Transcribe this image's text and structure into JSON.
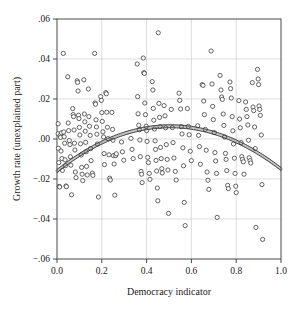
{
  "chart_data": {
    "type": "scatter",
    "title": "",
    "xlabel": "Democracy indicator",
    "ylabel": "Growth rate (unexplained part)",
    "xlim": [
      0.0,
      1.0
    ],
    "ylim": [
      -0.06,
      0.06
    ],
    "xticks": [
      0.0,
      0.2,
      0.4,
      0.6,
      0.8,
      1.0
    ],
    "xtick_labels": [
      "0.0",
      "0.2",
      "0.4",
      "0.6",
      "0.8",
      "1.0"
    ],
    "yticks": [
      0.06,
      0.04,
      0.02,
      0.0,
      -0.02,
      -0.04,
      -0.06
    ],
    "ytick_labels": [
      ".06",
      ".04",
      ".02",
      ".00",
      "−.02",
      "−.04",
      "−.06"
    ],
    "grid": true,
    "grid_color": "#cfcfcf",
    "frame_color": "#4a4a4a",
    "marker": {
      "shape": "circle-open",
      "radius": 2.1,
      "stroke": "#3d3d3d",
      "stroke_width": 0.8,
      "fill": "#ffffff"
    },
    "legend": "none",
    "series": [
      {
        "name": "Countries",
        "type": "scatter",
        "points": [
          [
            0.005,
            0.0076
          ],
          [
            0.005,
            0.0026
          ],
          [
            0.006,
            -0.0046
          ],
          [
            0.008,
            -0.0118
          ],
          [
            0.01,
            -0.0237
          ],
          [
            0.012,
            -0.024
          ],
          [
            0.014,
            0.0018
          ],
          [
            0.016,
            0.0008
          ],
          [
            0.018,
            -0.006
          ],
          [
            0.02,
            0.0031
          ],
          [
            0.022,
            -0.0098
          ],
          [
            0.024,
            -0.0157
          ],
          [
            0.028,
            0.0428
          ],
          [
            0.03,
            0.0035
          ],
          [
            0.032,
            0.0011
          ],
          [
            0.034,
            -0.0021
          ],
          [
            0.036,
            -0.0104
          ],
          [
            0.038,
            -0.0133
          ],
          [
            0.04,
            -0.0235
          ],
          [
            0.042,
            -0.0238
          ],
          [
            0.048,
            0.0311
          ],
          [
            0.05,
            0.008
          ],
          [
            0.052,
            0.0042
          ],
          [
            0.055,
            -0.0008
          ],
          [
            0.058,
            -0.0028
          ],
          [
            0.06,
            -0.0089
          ],
          [
            0.062,
            -0.0131
          ],
          [
            0.065,
            -0.0279
          ],
          [
            0.07,
            0.0152
          ],
          [
            0.072,
            0.0122
          ],
          [
            0.074,
            0.0112
          ],
          [
            0.076,
            0.0045
          ],
          [
            0.078,
            -0.0021
          ],
          [
            0.08,
            -0.0055
          ],
          [
            0.082,
            -0.0165
          ],
          [
            0.085,
            -0.0193
          ],
          [
            0.09,
            0.0291
          ],
          [
            0.092,
            0.0283
          ],
          [
            0.094,
            0.024
          ],
          [
            0.096,
            0.0119
          ],
          [
            0.098,
            0.0102
          ],
          [
            0.1,
            0.0058
          ],
          [
            0.102,
            0.002
          ],
          [
            0.105,
            -0.0024
          ],
          [
            0.108,
            -0.008
          ],
          [
            0.11,
            -0.0142
          ],
          [
            0.112,
            -0.0176
          ],
          [
            0.115,
            -0.0208
          ],
          [
            0.12,
            0.0296
          ],
          [
            0.122,
            0.0125
          ],
          [
            0.124,
            0.0086
          ],
          [
            0.126,
            0.0039
          ],
          [
            0.128,
            -0.0017
          ],
          [
            0.13,
            -0.0064
          ],
          [
            0.132,
            -0.0137
          ],
          [
            0.135,
            -0.018
          ],
          [
            0.14,
            0.025
          ],
          [
            0.142,
            0.0112
          ],
          [
            0.145,
            0.0064
          ],
          [
            0.148,
            0.0018
          ],
          [
            0.15,
            -0.0048
          ],
          [
            0.152,
            -0.0108
          ],
          [
            0.158,
            -0.0171
          ],
          [
            0.16,
            -0.0182
          ],
          [
            0.168,
            0.0428
          ],
          [
            0.17,
            0.018
          ],
          [
            0.172,
            0.0174
          ],
          [
            0.174,
            0.0096
          ],
          [
            0.176,
            0.006
          ],
          [
            0.178,
            0.0024
          ],
          [
            0.18,
            -0.0025
          ],
          [
            0.185,
            -0.029
          ],
          [
            0.195,
            0.0212
          ],
          [
            0.198,
            0.0193
          ],
          [
            0.2,
            0.0132
          ],
          [
            0.202,
            0.0088
          ],
          [
            0.205,
            0.0036
          ],
          [
            0.208,
            0.001
          ],
          [
            0.21,
            -0.0073
          ],
          [
            0.212,
            -0.0128
          ],
          [
            0.218,
            0.0232
          ],
          [
            0.22,
            0.0226
          ],
          [
            0.222,
            0.0134
          ],
          [
            0.225,
            0.0059
          ],
          [
            0.228,
            0.0002
          ],
          [
            0.232,
            -0.0079
          ],
          [
            0.235,
            -0.0196
          ],
          [
            0.238,
            -0.0205
          ],
          [
            0.245,
            0.0133
          ],
          [
            0.248,
            0.0048
          ],
          [
            0.25,
            -0.0006
          ],
          [
            0.252,
            -0.0083
          ],
          [
            0.255,
            -0.0125
          ],
          [
            0.258,
            -0.0281
          ],
          [
            0.262,
            -0.0083
          ],
          [
            0.265,
            -0.0074
          ],
          [
            0.288,
            -0.0015
          ],
          [
            0.292,
            -0.0064
          ],
          [
            0.298,
            -0.0106
          ],
          [
            0.33,
            0.0003
          ],
          [
            0.335,
            -0.0052
          ],
          [
            0.34,
            -0.0098
          ],
          [
            0.358,
            0.0375
          ],
          [
            0.36,
            0.0212
          ],
          [
            0.362,
            0.0126
          ],
          [
            0.365,
            0.0069
          ],
          [
            0.368,
            0.0046
          ],
          [
            0.37,
            -0.0005
          ],
          [
            0.372,
            -0.0088
          ],
          [
            0.375,
            -0.0162
          ],
          [
            0.378,
            -0.0176
          ],
          [
            0.38,
            -0.0218
          ],
          [
            0.385,
            0.0405
          ],
          [
            0.388,
            0.0332
          ],
          [
            0.39,
            0.0328
          ],
          [
            0.392,
            0.018
          ],
          [
            0.395,
            0.0122
          ],
          [
            0.398,
            0.0064
          ],
          [
            0.4,
            0.0042
          ],
          [
            0.402,
            -0.0012
          ],
          [
            0.405,
            -0.0092
          ],
          [
            0.408,
            -0.0118
          ],
          [
            0.412,
            -0.0172
          ],
          [
            0.415,
            -0.0202
          ],
          [
            0.425,
            0.0287
          ],
          [
            0.428,
            0.0245
          ],
          [
            0.43,
            0.0153
          ],
          [
            0.432,
            0.0094
          ],
          [
            0.435,
            0.005
          ],
          [
            0.438,
            -0.0009
          ],
          [
            0.44,
            -0.0052
          ],
          [
            0.442,
            -0.0107
          ],
          [
            0.445,
            -0.016
          ],
          [
            0.448,
            -0.0245
          ],
          [
            0.45,
            -0.0309
          ],
          [
            0.452,
            0.0531
          ],
          [
            0.455,
            0.0178
          ],
          [
            0.458,
            0.0108
          ],
          [
            0.46,
            0.0062
          ],
          [
            0.462,
            -0.0042
          ],
          [
            0.465,
            -0.0098
          ],
          [
            0.468,
            -0.0148
          ],
          [
            0.47,
            -0.017
          ],
          [
            0.478,
            0.0167
          ],
          [
            0.482,
            0.0116
          ],
          [
            0.485,
            0.0056
          ],
          [
            0.488,
            -0.0028
          ],
          [
            0.492,
            -0.0102
          ],
          [
            0.495,
            -0.0155
          ],
          [
            0.498,
            -0.0372
          ],
          [
            0.51,
            0.0148
          ],
          [
            0.515,
            0.0057
          ],
          [
            0.518,
            -0.0018
          ],
          [
            0.522,
            -0.0095
          ],
          [
            0.528,
            -0.0162
          ],
          [
            0.532,
            -0.0205
          ],
          [
            0.545,
            0.0229
          ],
          [
            0.548,
            0.0193
          ],
          [
            0.552,
            0.015
          ],
          [
            0.555,
            0.0062
          ],
          [
            0.558,
            0.0025
          ],
          [
            0.562,
            -0.0044
          ],
          [
            0.565,
            -0.0134
          ],
          [
            0.568,
            -0.0317
          ],
          [
            0.572,
            -0.0433
          ],
          [
            0.582,
            0.0152
          ],
          [
            0.586,
            0.0063
          ],
          [
            0.59,
            0.0021
          ],
          [
            0.595,
            -0.0061
          ],
          [
            0.6,
            -0.0108
          ],
          [
            0.628,
            0.0066
          ],
          [
            0.632,
            0.0018
          ],
          [
            0.636,
            -0.0038
          ],
          [
            0.64,
            -0.0126
          ],
          [
            0.648,
            0.0272
          ],
          [
            0.652,
            0.0268
          ],
          [
            0.655,
            0.019
          ],
          [
            0.658,
            0.0122
          ],
          [
            0.662,
            0.0048
          ],
          [
            0.666,
            -0.0056
          ],
          [
            0.67,
            -0.0165
          ],
          [
            0.674,
            -0.0206
          ],
          [
            0.678,
            -0.0252
          ],
          [
            0.688,
            0.044
          ],
          [
            0.692,
            0.0275
          ],
          [
            0.695,
            0.0163
          ],
          [
            0.698,
            0.0097
          ],
          [
            0.702,
            0.0032
          ],
          [
            0.705,
            -0.0068
          ],
          [
            0.708,
            -0.011
          ],
          [
            0.712,
            -0.0172
          ],
          [
            0.715,
            -0.0392
          ],
          [
            0.728,
            0.0318
          ],
          [
            0.732,
            0.0245
          ],
          [
            0.735,
            0.021
          ],
          [
            0.738,
            0.0198
          ],
          [
            0.742,
            0.0125
          ],
          [
            0.745,
            0.0068
          ],
          [
            0.748,
            0.001
          ],
          [
            0.752,
            -0.0072
          ],
          [
            0.755,
            -0.0102
          ],
          [
            0.758,
            -0.0158
          ],
          [
            0.762,
            -0.0232
          ],
          [
            0.765,
            -0.0248
          ],
          [
            0.772,
            0.0285
          ],
          [
            0.775,
            0.0252
          ],
          [
            0.778,
            0.0205
          ],
          [
            0.782,
            0.0112
          ],
          [
            0.785,
            0.0041
          ],
          [
            0.788,
            -0.0025
          ],
          [
            0.792,
            -0.0096
          ],
          [
            0.795,
            -0.0172
          ],
          [
            0.798,
            -0.0236
          ],
          [
            0.8,
            -0.0268
          ],
          [
            0.812,
            0.0192
          ],
          [
            0.815,
            0.01
          ],
          [
            0.818,
            0.0056
          ],
          [
            0.822,
            -0.0018
          ],
          [
            0.825,
            -0.0088
          ],
          [
            0.828,
            -0.0102
          ],
          [
            0.832,
            -0.0114
          ],
          [
            0.835,
            -0.0176
          ],
          [
            0.842,
            0.0185
          ],
          [
            0.845,
            0.0148
          ],
          [
            0.848,
            0.0112
          ],
          [
            0.852,
            0.007
          ],
          [
            0.855,
            -0.0006
          ],
          [
            0.858,
            -0.0094
          ],
          [
            0.862,
            -0.0108
          ],
          [
            0.865,
            -0.012
          ],
          [
            0.872,
            0.0282
          ],
          [
            0.875,
            0.016
          ],
          [
            0.878,
            0.0142
          ],
          [
            0.882,
            0.006
          ],
          [
            0.885,
            -0.0048
          ],
          [
            0.888,
            -0.0442
          ],
          [
            0.895,
            0.0348
          ],
          [
            0.898,
            0.03
          ],
          [
            0.9,
            0.0272
          ],
          [
            0.902,
            0.0165
          ],
          [
            0.905,
            0.0148
          ],
          [
            0.908,
            0.0118
          ],
          [
            0.912,
            0.002
          ],
          [
            0.915,
            -0.0228
          ],
          [
            0.918,
            -0.0502
          ]
        ]
      },
      {
        "name": "Fitted quadratic (confidence band)",
        "type": "line",
        "stroke": "#3a3a3a",
        "band_width_px": 3.6,
        "curve": {
          "form": "quadratic",
          "a": -0.0875,
          "b": 0.0885,
          "c": -0.016,
          "vertex_x": 0.506,
          "vertex_y": 0.0064,
          "y_at_x0": -0.016,
          "y_at_x1": -0.009
        }
      }
    ]
  }
}
